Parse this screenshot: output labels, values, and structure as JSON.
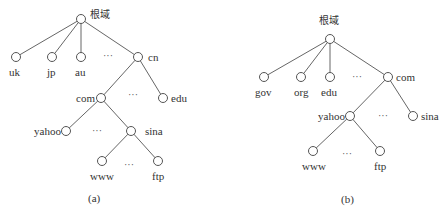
{
  "diagram_a": {
    "caption": "(a)",
    "root": "根域",
    "level1": [
      "uk",
      "jp",
      "au",
      "cn"
    ],
    "cn_children": [
      "com",
      "edu"
    ],
    "com_children": [
      "yahoo",
      "sina"
    ],
    "sina_children": [
      "www",
      "ftp"
    ],
    "ellipsis": "···"
  },
  "diagram_b": {
    "caption": "(b)",
    "root": "根域",
    "level1": [
      "gov",
      "org",
      "edu",
      "com"
    ],
    "com_children": [
      "yahoo",
      "sina"
    ],
    "yahoo_children": [
      "www",
      "ftp"
    ],
    "ellipsis": "···"
  },
  "colors": {
    "line": "#666666",
    "node_fill": "#ffffff",
    "text": "#333333"
  }
}
